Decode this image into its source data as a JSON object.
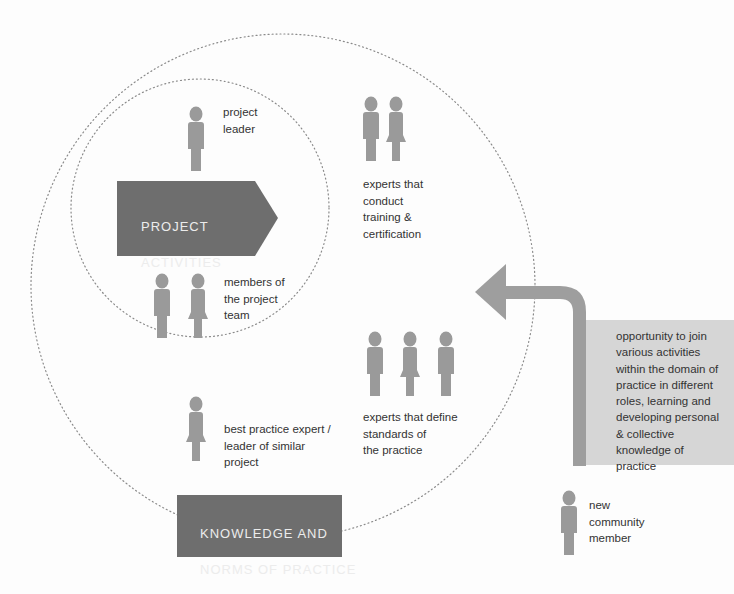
{
  "diagram": {
    "colors": {
      "figure": "#9a9a9a",
      "dark_box": "#6e6e6e",
      "info_box": "#d6d6d6",
      "arrow": "#9e9e9e",
      "dotted_circle": "#8a8a8a",
      "background": "#fdfdfd"
    },
    "circles": {
      "outer": {
        "label": "community of practice boundary",
        "style": "dotted"
      },
      "inner": {
        "label": "project boundary",
        "style": "dotted"
      }
    },
    "boxes": {
      "project_activities": {
        "line1": "PROJECT",
        "line2": "ACTIVITIES",
        "shape": "pentagon-arrow"
      },
      "knowledge_norms": {
        "line1": "KNOWLEDGE AND",
        "line2": "NORMS OF PRACTICE",
        "shape": "rectangle"
      }
    },
    "roles": [
      {
        "id": "project-leader",
        "label": "project\nleader",
        "figures": [
          "male"
        ]
      },
      {
        "id": "project-team",
        "label": "members of\nthe project\nteam",
        "figures": [
          "male",
          "female"
        ]
      },
      {
        "id": "training-experts",
        "label": "experts that\nconduct\ntraining &\ncertification",
        "figures": [
          "male",
          "female"
        ]
      },
      {
        "id": "standards-experts",
        "label": "experts that define\nstandards of\nthe practice",
        "figures": [
          "male",
          "female",
          "male"
        ]
      },
      {
        "id": "best-practice-expert",
        "label": "best practice expert /\nleader of similar\nproject",
        "figures": [
          "female"
        ]
      },
      {
        "id": "new-member",
        "label": "new\ncommunity\nmember",
        "figures": [
          "male"
        ]
      }
    ],
    "arrow": {
      "direction": "up-then-left",
      "icon": "bent-arrow-icon"
    },
    "info_box": {
      "text": "opportunity to join\nvarious activities\nwithin the domain of\npractice in different\nroles, learning and\ndeveloping personal\n& collective\nknowledge of\npractice"
    }
  }
}
